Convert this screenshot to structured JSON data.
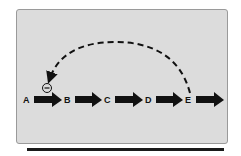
{
  "diagram": {
    "nodes": [
      "A",
      "B",
      "C",
      "D",
      "E"
    ],
    "feedback": {
      "from": "E",
      "to": "A",
      "style": "dashed",
      "sign_icon": "minus-circle-icon",
      "sign": "−"
    },
    "colors": {
      "panel": "#dcdcdc",
      "border": "#9a9a9a",
      "ink": "#111111"
    }
  }
}
